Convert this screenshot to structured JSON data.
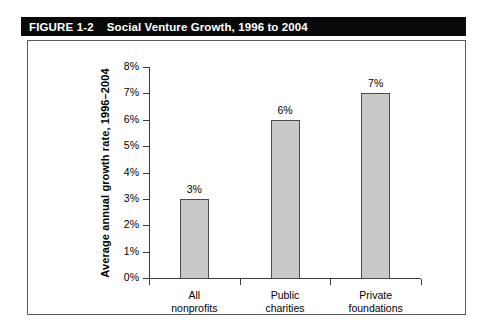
{
  "figure": {
    "number": "FIGURE 1-2",
    "caption": "Social Venture Growth, 1996 to 2004"
  },
  "chart_data": {
    "type": "bar",
    "title": "Social Venture Growth, 1996 to 2004",
    "categories": [
      "All nonprofits",
      "Public charities",
      "Private foundations"
    ],
    "category_lines": [
      [
        "All",
        "nonprofits"
      ],
      [
        "Public",
        "charities"
      ],
      [
        "Private",
        "foundations"
      ]
    ],
    "values": [
      3,
      6,
      7
    ],
    "value_labels": [
      "3%",
      "6%",
      "7%"
    ],
    "xlabel": "",
    "ylabel": "Average annual growth rate, 1996–2004",
    "ylim": [
      0,
      8
    ],
    "ytick_labels": [
      "0%",
      "1%",
      "2%",
      "3%",
      "4%",
      "5%",
      "6%",
      "7%",
      "8%"
    ],
    "ytick_values": [
      0,
      1,
      2,
      3,
      4,
      5,
      6,
      7,
      8
    ],
    "grid": false,
    "legend": null,
    "bar_fill_color": "#c9c9c9",
    "bar_border_color": "#4c4c4c",
    "axis_color": "#3b3b3b",
    "title_bar_color": "#090909",
    "title_text_color": "#ffffff",
    "background_color": "#ffffff"
  }
}
